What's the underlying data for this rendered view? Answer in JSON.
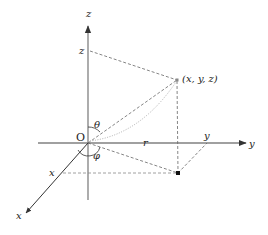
{
  "diagram": {
    "axes": {
      "x_label": "x",
      "y_label": "y",
      "z_label": "z"
    },
    "origin_label": "O",
    "point_label": "(x, y, z)",
    "projections": {
      "x_tick": "x",
      "y_tick": "y",
      "z_tick": "z"
    },
    "angles": {
      "polar": "θ",
      "azimuth": "φ"
    },
    "radius_label": "r",
    "colors": {
      "axis": "#7a7a7a",
      "dashed": "#666666",
      "point": "#111111"
    }
  }
}
